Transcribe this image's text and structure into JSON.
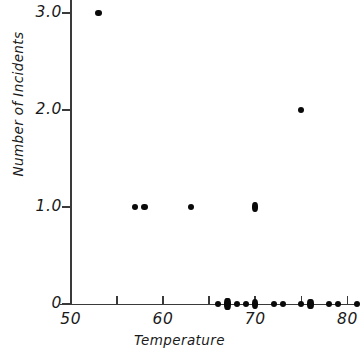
{
  "chart_data": {
    "type": "scatter",
    "title": "",
    "xlabel": "Temperature",
    "ylabel": "Number of Incidents",
    "xlim": [
      50,
      81.4
    ],
    "ylim": [
      -0.13,
      3.12
    ],
    "grid": false,
    "legend": null,
    "x_ticks": [
      {
        "value": 50,
        "label": "50"
      },
      {
        "value": 55,
        "label": ""
      },
      {
        "value": 60,
        "label": "60"
      },
      {
        "value": 65,
        "label": ""
      },
      {
        "value": 70,
        "label": "70"
      },
      {
        "value": 75,
        "label": ""
      },
      {
        "value": 80,
        "label": "80"
      }
    ],
    "y_ticks": [
      {
        "value": 0,
        "label": "0"
      },
      {
        "value": 1,
        "label": "1.0"
      },
      {
        "value": 2,
        "label": "2.0"
      },
      {
        "value": 3,
        "label": "3.0"
      }
    ],
    "marker": {
      "shape": "circle",
      "color": "#0a0a0a",
      "size": 6
    },
    "x": [
      53,
      57,
      58,
      63,
      66,
      67,
      67,
      67,
      68,
      69,
      70,
      70,
      70,
      70,
      72,
      73,
      75,
      75,
      76,
      76,
      78,
      79,
      81
    ],
    "y": [
      3,
      1,
      1,
      1,
      0,
      0,
      0,
      0,
      0,
      0,
      1,
      1,
      0,
      0,
      0,
      0,
      0,
      2,
      0,
      0,
      0,
      0,
      0
    ],
    "points": [
      {
        "x": 53,
        "y": 3,
        "count": 1
      },
      {
        "x": 57,
        "y": 1,
        "count": 1
      },
      {
        "x": 58,
        "y": 1,
        "count": 1
      },
      {
        "x": 63,
        "y": 1,
        "count": 1
      },
      {
        "x": 66,
        "y": 0,
        "count": 1
      },
      {
        "x": 67,
        "y": 0,
        "count": 3
      },
      {
        "x": 68,
        "y": 0,
        "count": 1
      },
      {
        "x": 69,
        "y": 0,
        "count": 1
      },
      {
        "x": 70,
        "y": 1,
        "count": 2
      },
      {
        "x": 70,
        "y": 0,
        "count": 2
      },
      {
        "x": 72,
        "y": 0,
        "count": 1
      },
      {
        "x": 73,
        "y": 0,
        "count": 1
      },
      {
        "x": 75,
        "y": 2,
        "count": 1
      },
      {
        "x": 75,
        "y": 0,
        "count": 1
      },
      {
        "x": 76,
        "y": 0,
        "count": 2
      },
      {
        "x": 78,
        "y": 0,
        "count": 1
      },
      {
        "x": 79,
        "y": 0,
        "count": 1
      },
      {
        "x": 81,
        "y": 0,
        "count": 1
      }
    ]
  }
}
